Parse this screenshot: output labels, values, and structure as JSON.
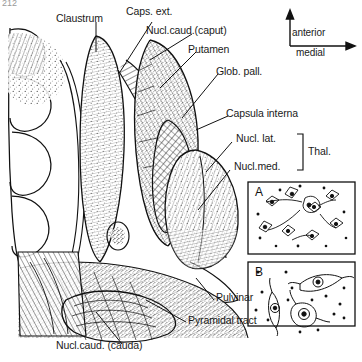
{
  "figure": {
    "page_number": "212",
    "kind": "anatomical-line-drawing",
    "ink_color": "#111111",
    "background_color": "#ffffff"
  },
  "orientation": {
    "vertical_arrow_label": "anterior",
    "horizontal_arrow_label": "medial",
    "vertical_direction": "up",
    "horizontal_direction": "right"
  },
  "labels": [
    {
      "id": "claustrum",
      "text": "Claustrum"
    },
    {
      "id": "caps-ext",
      "text": "Caps. ext."
    },
    {
      "id": "nucl-caud-caput",
      "text": "Nucl.caud.(caput)"
    },
    {
      "id": "putamen",
      "text": "Putamen"
    },
    {
      "id": "glob-pall",
      "text": "Glob. pall."
    },
    {
      "id": "capsula-interna",
      "text": "Capsula interna"
    },
    {
      "id": "nucl-lat",
      "text": "Nucl. lat."
    },
    {
      "id": "nucl-med",
      "text": "Nucl.med."
    },
    {
      "id": "thal",
      "text": "Thal."
    },
    {
      "id": "pulvinar",
      "text": "Pulvinar"
    },
    {
      "id": "pyramidal-tract",
      "text": "Pyramidal tract"
    },
    {
      "id": "nucl-caud-cauda",
      "text": "Nucl.caud. (cauda)"
    }
  ],
  "insets": [
    {
      "id": "A",
      "letter": "A",
      "content": "small multipolar neurons and glia"
    },
    {
      "id": "B",
      "letter": "B",
      "content": "large pyramidal-type neurons with nuclei"
    }
  ]
}
